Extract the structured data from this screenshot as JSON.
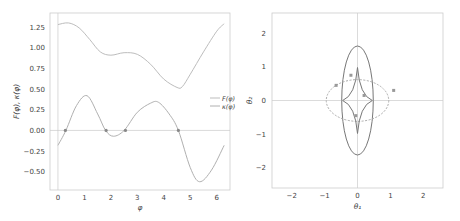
{
  "chart_data": [
    {
      "type": "line",
      "title": "",
      "xlabel": "φ",
      "ylabel": "F(φ), κ(φ)",
      "xlim": [
        -0.3,
        6.5
      ],
      "ylim": [
        -0.72,
        1.42
      ],
      "xticks": [
        "0",
        "1",
        "2",
        "3",
        "4",
        "5",
        "6"
      ],
      "yticks": [
        "1.25",
        "1.00",
        "0.75",
        "0.50",
        "0.25",
        "0.00",
        "−0.25",
        "−0.50"
      ],
      "legend": {
        "position": "right",
        "entries": [
          "F(φ)",
          "κ(φ)"
        ]
      },
      "grid": false,
      "series": [
        {
          "name": "F(φ)",
          "x": [
            0,
            0.4,
            0.8,
            1.2,
            1.6,
            2.0,
            2.5,
            3.0,
            3.5,
            4.0,
            4.5,
            4.7,
            5.0,
            5.5,
            6.0,
            6.28
          ],
          "y": [
            1.28,
            1.3,
            1.24,
            1.1,
            0.95,
            0.91,
            0.94,
            0.92,
            0.8,
            0.62,
            0.52,
            0.53,
            0.68,
            0.95,
            1.2,
            1.29
          ]
        },
        {
          "name": "κ(φ)",
          "x": [
            0,
            0.3,
            0.7,
            1.1,
            1.5,
            1.8,
            2.1,
            2.5,
            3.0,
            3.5,
            3.8,
            4.2,
            4.55,
            5.0,
            5.35,
            5.8,
            6.28
          ],
          "y": [
            -0.18,
            0.0,
            0.3,
            0.42,
            0.2,
            0.0,
            -0.07,
            0.0,
            0.22,
            0.33,
            0.34,
            0.2,
            0.0,
            -0.45,
            -0.62,
            -0.48,
            -0.18
          ]
        }
      ],
      "markers": {
        "x": [
          0.28,
          1.82,
          2.55,
          4.55
        ],
        "y": [
          0,
          0,
          0,
          0
        ]
      },
      "reference_lines": {
        "h": 0,
        "v": 0
      }
    },
    {
      "type": "line",
      "title": "",
      "xlabel": "θ₁",
      "ylabel": "θ₂",
      "xlim": [
        -2.6,
        2.6
      ],
      "ylim": [
        -2.6,
        2.6
      ],
      "xticks": [
        "−2",
        "−1",
        "0",
        "1",
        "2"
      ],
      "yticks": [
        "2",
        "1",
        "0",
        "−1",
        "−2"
      ],
      "grid": false,
      "curves": [
        {
          "name": "tall ellipse",
          "center": [
            0,
            0
          ],
          "rx": 0.48,
          "ry": 1.62,
          "style": "solid"
        },
        {
          "name": "wide ellipse",
          "center": [
            0,
            0
          ],
          "rx": 0.95,
          "ry": 0.62,
          "style": "dashed"
        },
        {
          "name": "astroid caustic",
          "cusps": [
            [
              0,
              0.98
            ],
            [
              0,
              -0.98
            ],
            [
              -0.45,
              0
            ],
            [
              0.45,
              0
            ]
          ],
          "style": "solid"
        }
      ],
      "points": [
        [
          -0.65,
          0.45
        ],
        [
          -0.2,
          0.75
        ],
        [
          1.1,
          0.3
        ],
        [
          0.2,
          0.15
        ],
        [
          -0.05,
          -0.45
        ]
      ],
      "reference_lines": {
        "h": 0,
        "v": 0
      }
    }
  ]
}
